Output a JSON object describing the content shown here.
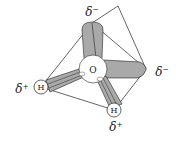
{
  "diagram": {
    "central_atom": {
      "symbol": "O"
    },
    "hydrogens": [
      {
        "symbol": "H",
        "charge_label": "δ⁺",
        "position": "left"
      },
      {
        "symbol": "H",
        "charge_label": "δ⁺",
        "position": "bottom"
      }
    ],
    "lone_pairs": [
      {
        "charge_label": "δ⁻",
        "position": "top"
      },
      {
        "charge_label": "δ⁻",
        "position": "right"
      }
    ],
    "colors": {
      "lobe_fill": "#a9a9a9",
      "line": "#222222",
      "atom_fill": "#ffffff"
    }
  }
}
